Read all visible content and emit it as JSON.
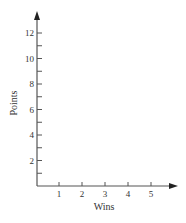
{
  "chart_data": {
    "type": "line",
    "title": "",
    "xlabel": "Wins",
    "ylabel": "Points",
    "x_ticks": [
      1,
      2,
      3,
      4,
      5
    ],
    "x_tick_labels": [
      "1",
      "2",
      "3",
      "4",
      "5"
    ],
    "y_ticks_major": [
      2,
      4,
      6,
      8,
      10,
      12
    ],
    "y_tick_labels": [
      "2",
      "4",
      "6",
      "8",
      "10",
      "12"
    ],
    "y_ticks_minor": [
      1,
      3,
      5,
      7,
      9,
      11
    ],
    "xlim": [
      0,
      6
    ],
    "ylim": [
      0,
      13
    ],
    "grid": false,
    "legend": null,
    "series": [],
    "axis_color": "#555555"
  }
}
